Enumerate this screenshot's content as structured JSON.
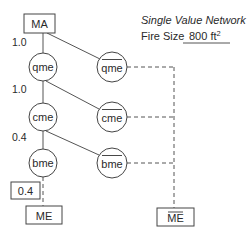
{
  "header": {
    "title": "Single Value Network",
    "fire_size_label": "Fire Size",
    "fire_size_value": "800 ft",
    "fire_size_unit_exponent": "2"
  },
  "nodes": {
    "root": {
      "label": "MA",
      "shape": "box"
    },
    "qme": {
      "label": "qme",
      "shape": "circle",
      "negated": false
    },
    "qme_bar": {
      "label": "qme",
      "shape": "circle",
      "negated": true
    },
    "cme": {
      "label": "cme",
      "shape": "circle",
      "negated": false
    },
    "cme_bar": {
      "label": "cme",
      "shape": "circle",
      "negated": true
    },
    "bme": {
      "label": "bme",
      "shape": "circle",
      "negated": false
    },
    "bme_bar": {
      "label": "bme",
      "shape": "circle",
      "negated": true
    },
    "me": {
      "label": "ME",
      "shape": "box",
      "negated": false
    },
    "me_bar": {
      "label": "ME",
      "shape": "box",
      "negated": true
    }
  },
  "probabilities": {
    "ma_to_qme": "1.0",
    "qme_to_cme": "1.0",
    "cme_to_bme": "0.4",
    "result_box": "0.4"
  },
  "colors": {
    "stroke": "#444444",
    "text": "#2a2a2a",
    "background": "#ffffff"
  }
}
